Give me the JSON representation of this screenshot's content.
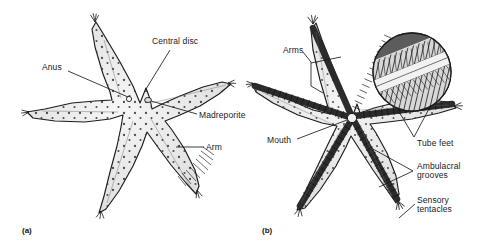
{
  "figure": {
    "background_color": "#ffffff",
    "ink_color": "#1a1a1a",
    "body_fill": "#e8e8e8",
    "body_fill_light": "#f2f2f2",
    "groove_color": "#4a4a4a"
  },
  "panels": [
    {
      "id": "a",
      "caption": "(a)",
      "view": "aboral (dorsal) surface",
      "center": {
        "x": 140,
        "y": 103
      },
      "labels": [
        {
          "key": "anus",
          "text": "Anus",
          "x": 42,
          "y": 64,
          "align": "left",
          "leader": {
            "x1": 68,
            "y1": 72,
            "x2": 128,
            "y2": 98
          }
        },
        {
          "key": "central_disc",
          "text": "Central disc",
          "x": 152,
          "y": 38,
          "align": "left",
          "leader": {
            "x1": 168,
            "y1": 50,
            "x2": 146,
            "y2": 88
          }
        },
        {
          "key": "madreporite",
          "text": "Madreporite",
          "x": 199,
          "y": 112,
          "align": "left",
          "leader": {
            "x1": 197,
            "y1": 115,
            "x2": 150,
            "y2": 101
          }
        },
        {
          "key": "arm",
          "text": "Arm",
          "x": 206,
          "y": 144,
          "align": "left",
          "leader": {
            "x1": 204,
            "y1": 148,
            "x2": 176,
            "y2": 148
          }
        }
      ]
    },
    {
      "id": "b",
      "caption": "(b)",
      "view": "oral (ventral) surface with magnified inset of tube feet",
      "center": {
        "x": 352,
        "y": 118
      },
      "inset": {
        "cx": 412,
        "cy": 72,
        "r": 39,
        "shows": "tube feet rows in ambulacral groove"
      },
      "labels": [
        {
          "key": "arms",
          "text": "Arms",
          "x": 283,
          "y": 47,
          "align": "left",
          "bracket": {
            "x": 311,
            "y_top": 56,
            "y_bot": 82,
            "tip1": {
              "x": 340,
              "y": 58
            },
            "tip2": {
              "x": 322,
              "y": 92
            },
            "stem": {
              "x1": 303,
              "y1": 52,
              "x2": 311,
              "y2": 64
            }
          }
        },
        {
          "key": "mouth",
          "text": "Mouth",
          "x": 267,
          "y": 137,
          "align": "left",
          "leader": {
            "x1": 297,
            "y1": 140,
            "x2": 347,
            "y2": 120
          }
        },
        {
          "key": "tube_feet",
          "text": "Tube feet",
          "x": 417,
          "y": 140,
          "align": "left",
          "bracket": {
            "x": 411,
            "y": 136,
            "tip1": {
              "x": 396,
              "y": 108
            },
            "tip2": {
              "x": 430,
              "y": 104
            }
          }
        },
        {
          "key": "ambulacral_grooves",
          "text": "Ambulacral\ngrooves",
          "x": 417,
          "y": 163,
          "align": "left",
          "bracket": {
            "x": 412,
            "y": 172,
            "tip1": {
              "x": 372,
              "y": 148
            },
            "tip2": {
              "x": 378,
              "y": 186
            }
          }
        },
        {
          "key": "sensory_tentacles",
          "text": "Sensory\ntentacles",
          "x": 417,
          "y": 197,
          "align": "left",
          "leader": {
            "x1": 415,
            "y1": 205,
            "x2": 398,
            "y2": 219
          }
        }
      ]
    }
  ]
}
